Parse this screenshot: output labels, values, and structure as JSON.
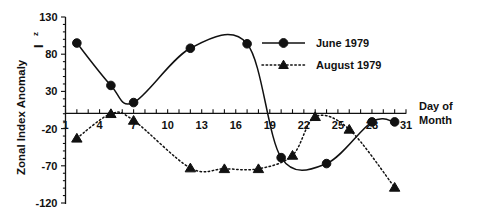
{
  "chart_data": {
    "type": "line",
    "title": "",
    "xlabel": "Day of Month",
    "ylabel": "Zonal Index Anomaly",
    "ylabel_symbol": "I",
    "ylabel_symbol_sub": "z",
    "xlim": [
      1,
      31
    ],
    "ylim": [
      -120,
      130
    ],
    "grid": false,
    "legend_position": "upper-right-inside",
    "y_ticks": [
      130,
      80,
      30,
      -20,
      -70,
      -120
    ],
    "y_tick_labels": [
      "130",
      "80",
      "30",
      "-20",
      "-70",
      "-120"
    ],
    "x_ticks": [
      1,
      4,
      7,
      10,
      13,
      16,
      19,
      22,
      25,
      28,
      31
    ],
    "x_tick_labels": [
      "1",
      "4",
      "7",
      "10",
      "13",
      "16",
      "19",
      "22",
      "25",
      "28",
      "31"
    ],
    "x_minor_tick_interval": 1,
    "series": [
      {
        "name": "June 1979",
        "marker": "circle",
        "linestyle": "solid",
        "color": "#111111",
        "x": [
          2,
          5,
          7,
          12,
          17,
          20,
          24,
          28,
          30
        ],
        "values": [
          95,
          38,
          15,
          88,
          94,
          -59,
          -67,
          -11,
          -11
        ]
      },
      {
        "name": "August 1979",
        "marker": "triangle",
        "linestyle": "dotted",
        "color": "#111111",
        "x": [
          2,
          5,
          7,
          12,
          15,
          18,
          21,
          23,
          26,
          30
        ],
        "values": [
          -33,
          0,
          -9,
          -73,
          -74,
          -74,
          -56,
          -4,
          -21,
          -99
        ]
      }
    ],
    "annotations": []
  },
  "legend": {
    "entries": [
      {
        "label": "June 1979",
        "marker": "circle",
        "linestyle": "solid"
      },
      {
        "label": "August 1979",
        "marker": "triangle",
        "linestyle": "dotted"
      }
    ]
  },
  "axis_titles": {
    "x_line1": "Day of",
    "x_line2": "Month"
  }
}
